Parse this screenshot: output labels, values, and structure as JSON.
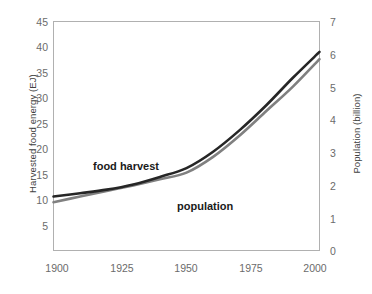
{
  "chart_data": {
    "type": "line",
    "title": "",
    "xlabel": "",
    "ylabel": "Harvested food energy (EJ)",
    "y2label": "Population (billion)",
    "x": [
      1900,
      1910,
      1920,
      1930,
      1940,
      1950,
      1960,
      1970,
      1980,
      1990,
      2000
    ],
    "xlim": [
      1900,
      2000
    ],
    "xticks": [
      1900,
      1925,
      1950,
      1975,
      2000
    ],
    "ylim": [
      0,
      45
    ],
    "yticks": [
      0,
      5,
      10,
      15,
      20,
      25,
      30,
      35,
      40,
      45
    ],
    "y2lim": [
      0,
      7
    ],
    "y2ticks": [
      0,
      1,
      2,
      3,
      4,
      5,
      6,
      7
    ],
    "grid": false,
    "legend": "inline-labels",
    "series": [
      {
        "name": "food harvest",
        "axis": "left",
        "unit": "EJ",
        "color": "#808080",
        "label_text": "food harvest",
        "values": [
          9.5,
          10.6,
          11.7,
          12.8,
          14.0,
          15.3,
          18.4,
          22.6,
          27.4,
          32.2,
          37.6
        ]
      },
      {
        "name": "population",
        "axis": "right",
        "unit": "billion",
        "color": "#262626",
        "label_text": "population",
        "values": [
          1.65,
          1.75,
          1.86,
          2.02,
          2.25,
          2.52,
          3.02,
          3.68,
          4.44,
          5.28,
          6.07
        ]
      }
    ],
    "annotations": [
      {
        "text": "food harvest",
        "x": 1925,
        "y_left": 18.5
      },
      {
        "text": "population",
        "x": 1962,
        "y_right": 2.35
      }
    ]
  },
  "axes": {
    "left_title": "Harvested food energy (EJ)",
    "right_title": "Population (billion)",
    "y_left_ticks": [
      "45",
      "40",
      "35",
      "30",
      "25",
      "20",
      "15",
      "10",
      "5"
    ],
    "y_right_ticks": [
      "7",
      "6",
      "5",
      "4",
      "3",
      "2",
      "1",
      "0"
    ],
    "x_ticks": [
      "1900",
      "1925",
      "1950",
      "1975",
      "2000"
    ]
  },
  "labels": {
    "food_harvest": "food harvest",
    "population": "population"
  },
  "colors": {
    "food_harvest_line": "#808080",
    "population_line": "#262626",
    "axis_border": "#b0b0b0",
    "tick_text": "#6b6b6b",
    "title_text": "#404040",
    "background": "#ffffff"
  }
}
